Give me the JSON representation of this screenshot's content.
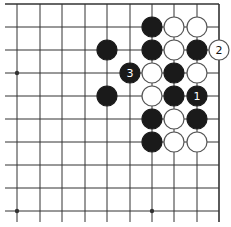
{
  "diagram": {
    "type": "go-board-fragment",
    "columns_x": [
      17,
      40,
      62,
      85,
      107,
      130,
      152,
      174,
      197,
      219
    ],
    "rows_y": [
      4,
      27,
      50,
      73,
      96,
      119,
      142,
      165,
      188,
      211
    ],
    "edges": {
      "top": true,
      "right": true,
      "left": false,
      "bottom": false
    },
    "hoshi": [
      {
        "col": 0,
        "row": 3
      },
      {
        "col": 6,
        "row": 9
      },
      {
        "col": 0,
        "row": 9
      }
    ],
    "stone_radius": 10,
    "colors": {
      "line": "#333333",
      "black": "#1a1a1a",
      "white": "#ffffff",
      "stone_outline": "#555555",
      "background": "#ffffff"
    },
    "stones": [
      {
        "col": 6,
        "row": 1,
        "color": "black",
        "label": ""
      },
      {
        "col": 7,
        "row": 1,
        "color": "white",
        "label": ""
      },
      {
        "col": 8,
        "row": 1,
        "color": "white",
        "label": ""
      },
      {
        "col": 4,
        "row": 2,
        "color": "black",
        "label": ""
      },
      {
        "col": 6,
        "row": 2,
        "color": "black",
        "label": ""
      },
      {
        "col": 7,
        "row": 2,
        "color": "white",
        "label": ""
      },
      {
        "col": 8,
        "row": 2,
        "color": "black",
        "label": ""
      },
      {
        "col": 9,
        "row": 2,
        "color": "white",
        "label": "2"
      },
      {
        "col": 5,
        "row": 3,
        "color": "black",
        "label": "3"
      },
      {
        "col": 6,
        "row": 3,
        "color": "white",
        "label": ""
      },
      {
        "col": 7,
        "row": 3,
        "color": "black",
        "label": ""
      },
      {
        "col": 8,
        "row": 3,
        "color": "white",
        "label": ""
      },
      {
        "col": 4,
        "row": 4,
        "color": "black",
        "label": ""
      },
      {
        "col": 6,
        "row": 4,
        "color": "white",
        "label": ""
      },
      {
        "col": 7,
        "row": 4,
        "color": "black",
        "label": ""
      },
      {
        "col": 8,
        "row": 4,
        "color": "black",
        "label": "1"
      },
      {
        "col": 6,
        "row": 5,
        "color": "black",
        "label": ""
      },
      {
        "col": 7,
        "row": 5,
        "color": "white",
        "label": ""
      },
      {
        "col": 8,
        "row": 5,
        "color": "black",
        "label": ""
      },
      {
        "col": 6,
        "row": 6,
        "color": "black",
        "label": ""
      },
      {
        "col": 7,
        "row": 6,
        "color": "white",
        "label": ""
      },
      {
        "col": 8,
        "row": 6,
        "color": "white",
        "label": ""
      }
    ]
  }
}
